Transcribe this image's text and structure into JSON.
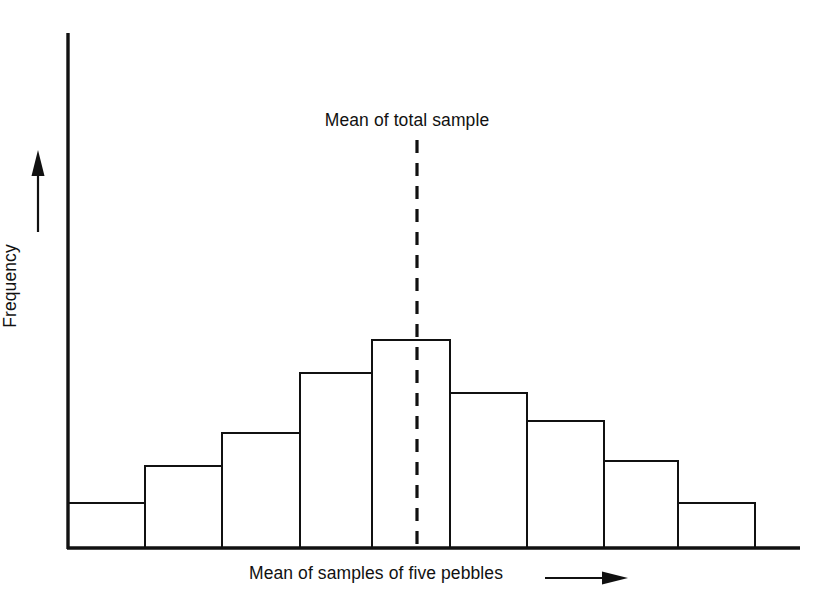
{
  "figure": {
    "background_color": "#ffffff",
    "ink_color": "#111111",
    "width": 824,
    "height": 611
  },
  "labels": {
    "mean_line": "Mean of total sample",
    "x_axis": "Mean of samples of five pebbles",
    "y_axis": "Frequency",
    "cropped_caption_top": ""
  },
  "icons": {
    "x_axis_arrow": "arrow-right-icon",
    "y_axis_arrow": "arrow-up-icon",
    "mean_line": "dashed-vertical-line-icon"
  },
  "chart_data": {
    "type": "bar",
    "title": "",
    "subtitle": "",
    "xlabel": "Mean of samples of five pebbles",
    "ylabel": "Frequency",
    "categories": [
      "1",
      "2",
      "3",
      "4",
      "5",
      "6",
      "7",
      "8",
      "9"
    ],
    "values": [
      1.0,
      1.6,
      2.1,
      3.2,
      3.8,
      2.9,
      2.4,
      1.7,
      1.0
    ],
    "value_unit": "relative frequency",
    "xlim": [
      0,
      9
    ],
    "ylim": [
      0,
      4.6
    ],
    "grid": false,
    "legend": null,
    "bar_style": {
      "fill": "#ffffff",
      "stroke": "#111111",
      "stroke_width": 2.6,
      "gap": 0
    },
    "annotations": [
      {
        "name": "mean-of-total-sample",
        "type": "vertical-dashed-line",
        "label": "Mean of total sample",
        "x_category_index": 4,
        "x_fraction_within_category": 0.5,
        "style": "dashed",
        "color": "#111111"
      }
    ],
    "axes": {
      "y_axis_arrow": true,
      "x_axis_arrow": true,
      "ticks_shown": false,
      "tick_labels_shown": false,
      "spines": [
        "left",
        "bottom"
      ]
    }
  },
  "geometry": {
    "plot_left": 68,
    "plot_right": 800,
    "baseline_y": 548,
    "y_axis_top": 33,
    "bar_width": 77,
    "bar_tops": [
      503,
      466,
      433,
      373,
      340,
      393,
      421,
      461,
      503
    ],
    "bar_lefts": [
      68,
      145,
      222,
      300,
      372,
      450,
      527,
      604,
      678
    ],
    "bar_rights": [
      145,
      222,
      300,
      372,
      450,
      527,
      604,
      678,
      755
    ],
    "mean_line_x": 417,
    "mean_line_top": 140
  }
}
